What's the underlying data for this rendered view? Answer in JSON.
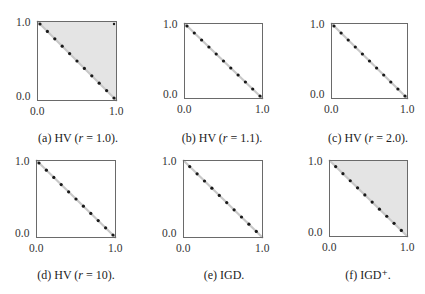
{
  "chart_data": [
    {
      "id": "a",
      "type": "scatter",
      "caption_prefix": "(a) HV (",
      "caption_var": "r",
      "caption_suffix": " = 1.0).",
      "xlim": [
        0.0,
        1.0
      ],
      "ylim": [
        0.0,
        1.0
      ],
      "xticks": [
        "0.0",
        "1.0"
      ],
      "yticks": [
        "0.0",
        "1.0"
      ],
      "front_line": true,
      "shaded_region": "upper-right triangle above front",
      "points": [
        [
          0.0,
          1.0
        ],
        [
          0.1,
          0.9
        ],
        [
          0.2,
          0.8
        ],
        [
          0.3,
          0.7
        ],
        [
          0.4,
          0.6
        ],
        [
          0.5,
          0.5
        ],
        [
          0.6,
          0.4
        ],
        [
          0.7,
          0.3
        ],
        [
          0.8,
          0.2
        ],
        [
          0.9,
          0.1
        ],
        [
          1.0,
          0.0
        ]
      ],
      "highlighted_points": [
        [
          0.1,
          0.9
        ],
        [
          0.2,
          0.8
        ],
        [
          0.4,
          0.6
        ],
        [
          0.5,
          0.5
        ],
        [
          0.6,
          0.4
        ],
        [
          0.7,
          0.3
        ],
        [
          0.9,
          0.1
        ]
      ],
      "extra_points": [
        [
          1.0,
          1.0
        ]
      ]
    },
    {
      "id": "b",
      "type": "scatter",
      "caption_prefix": "(b) HV (",
      "caption_var": "r",
      "caption_suffix": " = 1.1).",
      "xlim": [
        0.0,
        1.0
      ],
      "ylim": [
        0.0,
        1.0
      ],
      "xticks": [
        "0.0",
        "1.0"
      ],
      "yticks": [
        "0.0",
        "1.0"
      ],
      "front_line": true,
      "shaded_region": "none",
      "points": [
        [
          0.0,
          1.0
        ],
        [
          0.1,
          0.9
        ],
        [
          0.2,
          0.8
        ],
        [
          0.3,
          0.7
        ],
        [
          0.4,
          0.6
        ],
        [
          0.5,
          0.5
        ],
        [
          0.6,
          0.4
        ],
        [
          0.7,
          0.3
        ],
        [
          0.8,
          0.2
        ],
        [
          0.9,
          0.1
        ],
        [
          1.0,
          0.0
        ]
      ]
    },
    {
      "id": "c",
      "type": "scatter",
      "caption_prefix": "(c) HV (",
      "caption_var": "r",
      "caption_suffix": " = 2.0).",
      "xlim": [
        0.0,
        1.0
      ],
      "ylim": [
        0.0,
        1.0
      ],
      "xticks": [
        "0.0",
        "1.0"
      ],
      "yticks": [
        "0.0",
        "1.0"
      ],
      "front_line": true,
      "shaded_region": "none",
      "points": [
        [
          0.0,
          1.0
        ],
        [
          0.1,
          0.9
        ],
        [
          0.2,
          0.8
        ],
        [
          0.3,
          0.7
        ],
        [
          0.4,
          0.6
        ],
        [
          0.5,
          0.5
        ],
        [
          0.6,
          0.4
        ],
        [
          0.7,
          0.3
        ],
        [
          0.8,
          0.2
        ],
        [
          0.9,
          0.1
        ],
        [
          1.0,
          0.0
        ]
      ]
    },
    {
      "id": "d",
      "type": "scatter",
      "caption_prefix": "(d) HV (",
      "caption_var": "r",
      "caption_suffix": " = 10).",
      "xlim": [
        0.0,
        1.0
      ],
      "ylim": [
        0.0,
        1.0
      ],
      "xticks": [
        "0.0",
        "1.0"
      ],
      "yticks": [
        "0.0",
        "1.0"
      ],
      "front_line": true,
      "shaded_region": "none",
      "points": [
        [
          0.0,
          1.0
        ],
        [
          0.1,
          0.9
        ],
        [
          0.2,
          0.8
        ],
        [
          0.3,
          0.7
        ],
        [
          0.4,
          0.6
        ],
        [
          0.5,
          0.5
        ],
        [
          0.6,
          0.4
        ],
        [
          0.7,
          0.3
        ],
        [
          0.8,
          0.2
        ],
        [
          0.9,
          0.1
        ],
        [
          1.0,
          0.0
        ]
      ]
    },
    {
      "id": "e",
      "type": "scatter",
      "caption_prefix": "(e) IGD.",
      "caption_var": "",
      "caption_suffix": "",
      "xlim": [
        0.0,
        1.0
      ],
      "ylim": [
        0.0,
        1.0
      ],
      "xticks": [
        "0.0",
        "1.0"
      ],
      "yticks": [
        "0.0",
        "1.0"
      ],
      "front_line": true,
      "shaded_region": "none",
      "points": [
        [
          0.05,
          0.95
        ],
        [
          0.15,
          0.85
        ],
        [
          0.25,
          0.75
        ],
        [
          0.35,
          0.65
        ],
        [
          0.45,
          0.55
        ],
        [
          0.55,
          0.45
        ],
        [
          0.65,
          0.35
        ],
        [
          0.75,
          0.25
        ],
        [
          0.85,
          0.15
        ],
        [
          0.95,
          0.05
        ]
      ]
    },
    {
      "id": "f",
      "type": "scatter",
      "caption_prefix": "(f) IGD",
      "caption_var": "",
      "caption_suffix": "⁺.",
      "xlim": [
        0.0,
        1.0
      ],
      "ylim": [
        0.0,
        1.0
      ],
      "xticks": [
        "0.0",
        "1.0"
      ],
      "yticks": [
        "0.0",
        "1.0"
      ],
      "front_line": true,
      "shaded_region": "upper-right triangle above front",
      "points": [
        [
          0.05,
          0.95
        ],
        [
          0.15,
          0.85
        ],
        [
          0.25,
          0.75
        ],
        [
          0.35,
          0.65
        ],
        [
          0.45,
          0.55
        ],
        [
          0.55,
          0.45
        ],
        [
          0.65,
          0.35
        ],
        [
          0.75,
          0.25
        ],
        [
          0.85,
          0.15
        ],
        [
          0.95,
          0.05
        ]
      ]
    }
  ],
  "style": {
    "shade_color": "#e4e4e4",
    "front_line_color": "#c8c8c8",
    "point_color": "#1a1a1a",
    "border_color": "#6a6a6a"
  }
}
